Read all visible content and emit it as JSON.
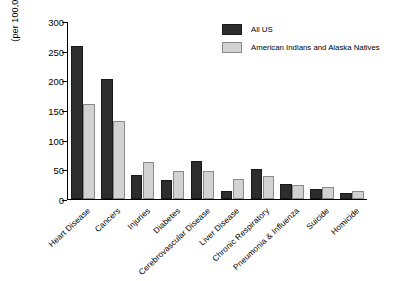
{
  "chart_data": {
    "type": "bar",
    "title": "",
    "subtitle": "",
    "xlabel": "",
    "ylabel": "(per 100,000)",
    "ylim": [
      0,
      300
    ],
    "yticks": [
      0,
      50,
      100,
      150,
      200,
      250,
      300
    ],
    "ytick_labels": [
      "0",
      "50",
      "100",
      "150",
      "200",
      "250",
      "300"
    ],
    "grid": false,
    "legend_position": "top-right",
    "categories": [
      "Heart Disease",
      "Cancers",
      "Injuries",
      "Diabetes",
      "Cerebrovascular Disease",
      "Liver Disease",
      "Chronic Respiratory",
      "Pneumonia & Influenza",
      "Suicide",
      "Homicide"
    ],
    "series": [
      {
        "name": "All US",
        "color": "#2d2d2d",
        "values": [
          260,
          203,
          40,
          33,
          65,
          13,
          51,
          26,
          17,
          10
        ]
      },
      {
        "name": "American Indians and Alaska Natives",
        "color": "#d2d2d2",
        "values": [
          161,
          132,
          62,
          48,
          48,
          34,
          39,
          23,
          20,
          14
        ]
      }
    ]
  },
  "legend": {
    "items": [
      {
        "label": "All US",
        "swatch": "dark"
      },
      {
        "label": "American Indians and Alaska Natives",
        "swatch": "light"
      }
    ]
  }
}
